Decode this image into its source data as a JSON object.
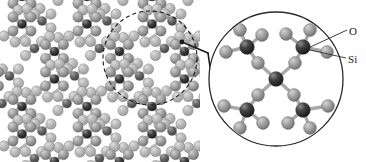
{
  "figure": {
    "name": "silica-crystal-structure-with-magnified-inset",
    "background_color": "#ffffff",
    "width": 366,
    "height": 162
  },
  "labels": {
    "oxygen": "O",
    "silicon": "Si"
  },
  "legend": {
    "items": [
      {
        "key": "oxygen",
        "label": "O",
        "color": "#9b9b9b",
        "role": "oxygen-atom"
      },
      {
        "key": "silicon",
        "label": "Si",
        "color": "#3a3a3a",
        "role": "silicon-atom"
      }
    ]
  },
  "colors": {
    "oxygen_atom": "#9b9b9b",
    "oxygen_atom_highlight": "#c9c9c9",
    "oxygen_atom_shadow": "#6f6f6f",
    "silicon_atom": "#3a3a3a",
    "silicon_atom_highlight": "#8a8a8a",
    "silicon_atom_shadow": "#1b1b1b",
    "bond": "#a8a8a8",
    "bond_dark": "#8c8c8c",
    "outline": "#2b2b2b",
    "leader_line": "#2b2b2b",
    "background": "#ffffff"
  },
  "lattice": {
    "description": "periodic silica framework viewed along a channel axis",
    "region": {
      "x": 0,
      "y": 0,
      "width": 200,
      "height": 162
    },
    "cell_dx": 65,
    "cell_dy": 55,
    "atom_radius_oxygen": 5.2,
    "atom_radius_silicon": 4.6
  },
  "selection_circle": {
    "name": "dashed-selection-circle",
    "cx": 150,
    "cy": 58,
    "r": 47,
    "stroke": "#1a1a1a",
    "dash": "4 3",
    "stroke_width": 1.1
  },
  "callout": {
    "name": "callout-connector",
    "anchor_dot": {
      "cx": 182,
      "cy": 42,
      "r": 2.4
    },
    "segments": [
      {
        "x1": 182,
        "y1": 42,
        "x2": 208,
        "y2": 53
      },
      {
        "x1": 208,
        "y1": 53,
        "x2": 211,
        "y2": 74
      }
    ],
    "stroke": "#1a1a1a",
    "stroke_width": 1.6
  },
  "inset_circle": {
    "name": "magnified-inset-circle",
    "cx": 276,
    "cy": 79,
    "r": 67,
    "stroke": "#2b2b2b",
    "stroke_width": 1.3,
    "fill": "#ffffff"
  },
  "leader_lines": [
    {
      "name": "oxygen-leader-line",
      "label": "O",
      "x1": 306,
      "y1": 49,
      "x2": 347,
      "y2": 30
    },
    {
      "name": "silicon-leader-line",
      "label": "Si",
      "x1": 301,
      "y1": 48,
      "x2": 346,
      "y2": 58
    }
  ],
  "inset_structure": {
    "type": "SiO4-tetrahedral-network",
    "center_silicon": {
      "cx": 276,
      "cy": 79
    },
    "bridging_oxygens": [
      {
        "cx": 258,
        "cy": 63
      },
      {
        "cx": 295,
        "cy": 63
      },
      {
        "cx": 258,
        "cy": 95
      },
      {
        "cx": 294,
        "cy": 95
      }
    ],
    "corner_silicons": [
      {
        "cx": 247,
        "cy": 47,
        "name": "silicon-top-left"
      },
      {
        "cx": 303,
        "cy": 47,
        "name": "silicon-top-right"
      },
      {
        "cx": 247,
        "cy": 110,
        "name": "silicon-bottom-left"
      },
      {
        "cx": 303,
        "cy": 110,
        "name": "silicon-bottom-right"
      }
    ],
    "terminal_oxygens": [
      {
        "cx": 226,
        "cy": 52
      },
      {
        "cx": 240,
        "cy": 30
      },
      {
        "cx": 262,
        "cy": 35
      },
      {
        "cx": 286,
        "cy": 34
      },
      {
        "cx": 310,
        "cy": 30
      },
      {
        "cx": 327,
        "cy": 52
      },
      {
        "cx": 224,
        "cy": 106
      },
      {
        "cx": 240,
        "cy": 128
      },
      {
        "cx": 263,
        "cy": 123
      },
      {
        "cx": 288,
        "cy": 123
      },
      {
        "cx": 310,
        "cy": 128
      },
      {
        "cx": 328,
        "cy": 106
      }
    ],
    "atom_radius_oxygen": 6.4,
    "atom_radius_silicon": 7.4,
    "bond_width": 3.4
  }
}
